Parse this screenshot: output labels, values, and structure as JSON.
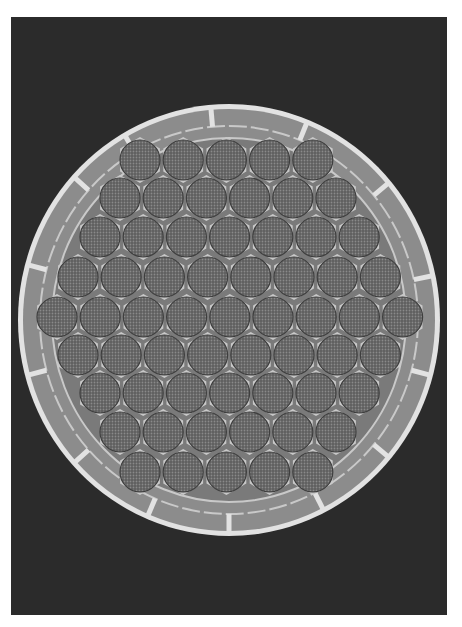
{
  "image": {
    "subject": "cross-section micrograph of multifilament bundle",
    "background_color": "#2b2b2b",
    "frame_color": "#ffffff",
    "outer_ring_color": "#e2e2e2",
    "ring_band_color": "#8c8c8c",
    "hex_fill_color": "#6b6b6b",
    "hex_border_color": "#c9c9c9",
    "ellipse": {
      "cx": 229,
      "cy": 320,
      "rx": 211,
      "ry": 216
    },
    "hex_rows": [
      {
        "y": 160,
        "count": 5,
        "x0": 140
      },
      {
        "y": 198,
        "count": 6,
        "x0": 120
      },
      {
        "y": 237,
        "count": 7,
        "x0": 100
      },
      {
        "y": 277,
        "count": 8,
        "x0": 78
      },
      {
        "y": 317,
        "count": 9,
        "x0": 57
      },
      {
        "y": 355,
        "count": 8,
        "x0": 78
      },
      {
        "y": 393,
        "count": 7,
        "x0": 100
      },
      {
        "y": 432,
        "count": 6,
        "x0": 120
      },
      {
        "y": 472,
        "count": 5,
        "x0": 140
      }
    ],
    "hex_spacing": 43.2,
    "hex_radius": 21,
    "total_filament_groups": 61,
    "spoke_angles_deg": [
      -120,
      -95,
      -68,
      -40,
      -12,
      15,
      40,
      63,
      90,
      113,
      138,
      165,
      195,
      222
    ]
  }
}
